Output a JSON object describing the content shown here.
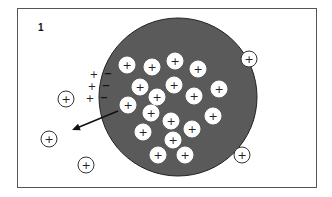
{
  "diagram": {
    "region_labels": [
      {
        "id": "outside",
        "text": "1"
      },
      {
        "id": "inside",
        "text": "2"
      }
    ],
    "cell": {
      "cx": 178,
      "cy": 97,
      "r": 79,
      "fill": "#5a5a5a"
    },
    "ion_symbol": "+",
    "membrane_charges": {
      "outer": [
        "+",
        "+",
        "+"
      ],
      "inner": [
        "−",
        "−",
        "−"
      ]
    },
    "inside_ions": [
      [
        127,
        65
      ],
      [
        152,
        67
      ],
      [
        175,
        61
      ],
      [
        198,
        69
      ],
      [
        140,
        87
      ],
      [
        174,
        85
      ],
      [
        219,
        89
      ],
      [
        157,
        97
      ],
      [
        194,
        96
      ],
      [
        128,
        105
      ],
      [
        151,
        113
      ],
      [
        171,
        121
      ],
      [
        213,
        116
      ],
      [
        192,
        129
      ],
      [
        143,
        132
      ],
      [
        173,
        140
      ],
      [
        158,
        155
      ],
      [
        185,
        155
      ]
    ],
    "outside_ions": [
      [
        66,
        99
      ],
      [
        249,
        59
      ],
      [
        49,
        139
      ],
      [
        86,
        165
      ],
      [
        242,
        155
      ]
    ],
    "arrow": {
      "from": [
        118,
        111
      ],
      "to": [
        72,
        130
      ],
      "meaning": "ion leaving cell"
    }
  }
}
